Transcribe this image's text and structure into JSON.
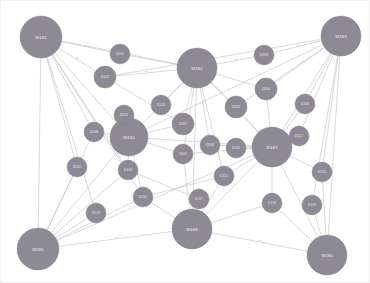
{
  "panel": {
    "title": "network-graph",
    "background_color": "#ffffff",
    "node_fill_color": "#8d8a95",
    "node_stroke_color": "#7d7a86",
    "node_label_color": "#f2f1f4",
    "edge_color": "#b9b9be",
    "edge_label_color": "#8a8a92",
    "border_color": "#f0f0f2"
  },
  "chart_data": {
    "type": "network",
    "title": "",
    "layout": "force-directed",
    "node_count": 31,
    "edge_count": 72,
    "nodes": [
      {
        "id": "n0",
        "label": "W181",
        "x": 41,
        "y": 37,
        "r": 21,
        "size": "large"
      },
      {
        "id": "n1",
        "label": "W182",
        "x": 197,
        "y": 68,
        "r": 20,
        "size": "large"
      },
      {
        "id": "n2",
        "label": "W183",
        "x": 341,
        "y": 36,
        "r": 20,
        "size": "large"
      },
      {
        "id": "n3",
        "label": "W184",
        "x": 129,
        "y": 137,
        "r": 19,
        "size": "large"
      },
      {
        "id": "n4",
        "label": "W187",
        "x": 272,
        "y": 147,
        "r": 20,
        "size": "large"
      },
      {
        "id": "n5",
        "label": "W185",
        "x": 38,
        "y": 249,
        "r": 21,
        "size": "large"
      },
      {
        "id": "n6",
        "label": "W188",
        "x": 192,
        "y": 229,
        "r": 20,
        "size": "large"
      },
      {
        "id": "n7",
        "label": "W186",
        "x": 327,
        "y": 255,
        "r": 20,
        "size": "large"
      },
      {
        "id": "n8",
        "label": "D101",
        "x": 120,
        "y": 54,
        "r": 10,
        "size": "small"
      },
      {
        "id": "n9",
        "label": "D102",
        "x": 105,
        "y": 77,
        "r": 11,
        "size": "small"
      },
      {
        "id": "n10",
        "label": "D103",
        "x": 264,
        "y": 55,
        "r": 10,
        "size": "small"
      },
      {
        "id": "n11",
        "label": "D104",
        "x": 266,
        "y": 89,
        "r": 11,
        "size": "small"
      },
      {
        "id": "n12",
        "label": "D105",
        "x": 236,
        "y": 107,
        "r": 11,
        "size": "small"
      },
      {
        "id": "n13",
        "label": "D106",
        "x": 305,
        "y": 104,
        "r": 10,
        "size": "small"
      },
      {
        "id": "n14",
        "label": "D107",
        "x": 183,
        "y": 124,
        "r": 11,
        "size": "small"
      },
      {
        "id": "n15",
        "label": "D108",
        "x": 94,
        "y": 132,
        "r": 10,
        "size": "small"
      },
      {
        "id": "n16",
        "label": "D109",
        "x": 210,
        "y": 145,
        "r": 10,
        "size": "small"
      },
      {
        "id": "n17",
        "label": "D110",
        "x": 236,
        "y": 148,
        "r": 10,
        "size": "small"
      },
      {
        "id": "n18",
        "label": "D111",
        "x": 183,
        "y": 154,
        "r": 10,
        "size": "small"
      },
      {
        "id": "n19",
        "label": "D112",
        "x": 77,
        "y": 167,
        "r": 10,
        "size": "small"
      },
      {
        "id": "n20",
        "label": "D113",
        "x": 128,
        "y": 170,
        "r": 10,
        "size": "small"
      },
      {
        "id": "n21",
        "label": "D114",
        "x": 224,
        "y": 176,
        "r": 10,
        "size": "small"
      },
      {
        "id": "n22",
        "label": "D115",
        "x": 322,
        "y": 172,
        "r": 10,
        "size": "small"
      },
      {
        "id": "n23",
        "label": "D116",
        "x": 143,
        "y": 197,
        "r": 10,
        "size": "small"
      },
      {
        "id": "n24",
        "label": "D117",
        "x": 199,
        "y": 199,
        "r": 10,
        "size": "small"
      },
      {
        "id": "n25",
        "label": "D118",
        "x": 272,
        "y": 203,
        "r": 10,
        "size": "small"
      },
      {
        "id": "n26",
        "label": "D119",
        "x": 312,
        "y": 205,
        "r": 10,
        "size": "small"
      },
      {
        "id": "n27",
        "label": "D120",
        "x": 96,
        "y": 213,
        "r": 10,
        "size": "small"
      },
      {
        "id": "n28",
        "label": "D121",
        "x": 124,
        "y": 115,
        "r": 10,
        "size": "small"
      },
      {
        "id": "n29",
        "label": "D122",
        "x": 299,
        "y": 136,
        "r": 10,
        "size": "small"
      },
      {
        "id": "n30",
        "label": "D123",
        "x": 161,
        "y": 105,
        "r": 10,
        "size": "small"
      }
    ],
    "edges": [
      {
        "source": "n0",
        "target": "n8",
        "label": "r1"
      },
      {
        "source": "n0",
        "target": "n9",
        "label": "r2"
      },
      {
        "source": "n0",
        "target": "n15",
        "label": ""
      },
      {
        "source": "n0",
        "target": "n19",
        "label": ""
      },
      {
        "source": "n0",
        "target": "n5",
        "label": ""
      },
      {
        "source": "n0",
        "target": "n3",
        "label": ""
      },
      {
        "source": "n0",
        "target": "n1",
        "label": "r3"
      },
      {
        "source": "n0",
        "target": "n27",
        "label": ""
      },
      {
        "source": "n0",
        "target": "n20",
        "label": ""
      },
      {
        "source": "n0",
        "target": "n23",
        "label": ""
      },
      {
        "source": "n1",
        "target": "n8",
        "label": ""
      },
      {
        "source": "n1",
        "target": "n9",
        "label": "r4"
      },
      {
        "source": "n1",
        "target": "n10",
        "label": "r5"
      },
      {
        "source": "n1",
        "target": "n11",
        "label": ""
      },
      {
        "source": "n1",
        "target": "n12",
        "label": ""
      },
      {
        "source": "n1",
        "target": "n14",
        "label": ""
      },
      {
        "source": "n1",
        "target": "n16",
        "label": ""
      },
      {
        "source": "n1",
        "target": "n18",
        "label": ""
      },
      {
        "source": "n1",
        "target": "n30",
        "label": ""
      },
      {
        "source": "n1",
        "target": "n4",
        "label": ""
      },
      {
        "source": "n1",
        "target": "n3",
        "label": ""
      },
      {
        "source": "n1",
        "target": "n21",
        "label": ""
      },
      {
        "source": "n2",
        "target": "n10",
        "label": "r6"
      },
      {
        "source": "n2",
        "target": "n11",
        "label": ""
      },
      {
        "source": "n2",
        "target": "n13",
        "label": ""
      },
      {
        "source": "n2",
        "target": "n12",
        "label": ""
      },
      {
        "source": "n2",
        "target": "n4",
        "label": ""
      },
      {
        "source": "n2",
        "target": "n22",
        "label": ""
      },
      {
        "source": "n2",
        "target": "n26",
        "label": ""
      },
      {
        "source": "n2",
        "target": "n9",
        "label": ""
      },
      {
        "source": "n2",
        "target": "n3",
        "label": ""
      },
      {
        "source": "n2",
        "target": "n29",
        "label": ""
      },
      {
        "source": "n3",
        "target": "n15",
        "label": ""
      },
      {
        "source": "n3",
        "target": "n20",
        "label": ""
      },
      {
        "source": "n3",
        "target": "n28",
        "label": ""
      },
      {
        "source": "n3",
        "target": "n14",
        "label": ""
      },
      {
        "source": "n3",
        "target": "n18",
        "label": ""
      },
      {
        "source": "n3",
        "target": "n4",
        "label": ""
      },
      {
        "source": "n3",
        "target": "n23",
        "label": ""
      },
      {
        "source": "n3",
        "target": "n5",
        "label": ""
      },
      {
        "source": "n4",
        "target": "n11",
        "label": ""
      },
      {
        "source": "n4",
        "target": "n12",
        "label": ""
      },
      {
        "source": "n4",
        "target": "n13",
        "label": ""
      },
      {
        "source": "n4",
        "target": "n16",
        "label": ""
      },
      {
        "source": "n4",
        "target": "n17",
        "label": ""
      },
      {
        "source": "n4",
        "target": "n21",
        "label": ""
      },
      {
        "source": "n4",
        "target": "n22",
        "label": ""
      },
      {
        "source": "n4",
        "target": "n25",
        "label": ""
      },
      {
        "source": "n4",
        "target": "n29",
        "label": ""
      },
      {
        "source": "n4",
        "target": "n6",
        "label": ""
      },
      {
        "source": "n4",
        "target": "n7",
        "label": ""
      },
      {
        "source": "n4",
        "target": "n18",
        "label": ""
      },
      {
        "source": "n5",
        "target": "n19",
        "label": ""
      },
      {
        "source": "n5",
        "target": "n20",
        "label": ""
      },
      {
        "source": "n5",
        "target": "n23",
        "label": ""
      },
      {
        "source": "n5",
        "target": "n27",
        "label": ""
      },
      {
        "source": "n5",
        "target": "n6",
        "label": "r7"
      },
      {
        "source": "n5",
        "target": "n15",
        "label": ""
      },
      {
        "source": "n5",
        "target": "n4",
        "label": ""
      },
      {
        "source": "n6",
        "target": "n24",
        "label": ""
      },
      {
        "source": "n6",
        "target": "n21",
        "label": ""
      },
      {
        "source": "n6",
        "target": "n18",
        "label": ""
      },
      {
        "source": "n6",
        "target": "n23",
        "label": ""
      },
      {
        "source": "n6",
        "target": "n25",
        "label": ""
      },
      {
        "source": "n6",
        "target": "n7",
        "label": "r8"
      },
      {
        "source": "n6",
        "target": "n1",
        "label": ""
      },
      {
        "source": "n7",
        "target": "n25",
        "label": ""
      },
      {
        "source": "n7",
        "target": "n26",
        "label": ""
      },
      {
        "source": "n7",
        "target": "n22",
        "label": ""
      },
      {
        "source": "n7",
        "target": "n2",
        "label": ""
      },
      {
        "source": "n9",
        "target": "n14",
        "label": ""
      },
      {
        "source": "n20",
        "target": "n24",
        "label": ""
      },
      {
        "source": "n23",
        "target": "n21",
        "label": ""
      }
    ]
  }
}
